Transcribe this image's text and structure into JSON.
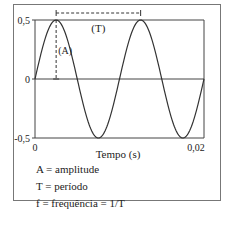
{
  "chart_data": {
    "type": "line",
    "title": "",
    "xlabel": "Tempo (s)",
    "ylabel": "",
    "xlim": [
      0,
      0.02
    ],
    "ylim": [
      -0.5,
      0.5
    ],
    "x_ticks": [
      {
        "value": 0,
        "label": "0"
      },
      {
        "value": 0.02,
        "label": "0,02"
      }
    ],
    "y_ticks": [
      {
        "value": 0.5,
        "label": "0,5"
      },
      {
        "value": 0,
        "label": "0"
      },
      {
        "value": -0.5,
        "label": "-0,5"
      }
    ],
    "series": [
      {
        "name": "sine",
        "function": "A*sin(2*pi*t/T)",
        "amplitude": 0.5,
        "period": 0.01,
        "color": "#333333"
      }
    ],
    "annotations": {
      "period_label": "(T)",
      "period_from": 0.0025,
      "period_to": 0.0125,
      "amplitude_label": "(A)",
      "amplitude_at": 0.0025
    },
    "legend_text": [
      "A = amplitude",
      "T = período",
      "f = frequência = 1/T"
    ],
    "grid": false
  }
}
